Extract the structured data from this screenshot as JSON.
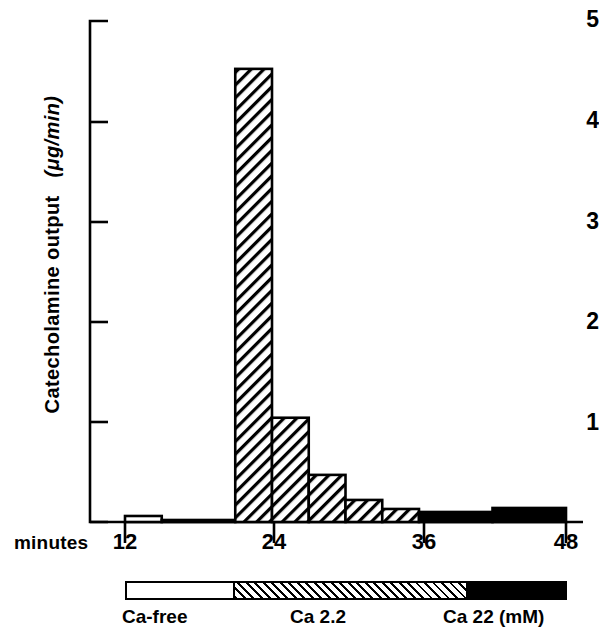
{
  "chart_data": {
    "type": "bar",
    "title": "",
    "xlabel": "minutes",
    "ylabel": "Catecholamine output  (μg/min)",
    "ylabel_parts": {
      "main": "Catecholamine output",
      "units": "(μg/min)"
    },
    "xlim": [
      12,
      48
    ],
    "ylim": [
      0,
      5
    ],
    "grid": false,
    "legend_position": "below-axis",
    "xticks": [
      12,
      24,
      36,
      48
    ],
    "xtick_labels": [
      "12",
      "24",
      "36",
      "48"
    ],
    "yticks": [
      1,
      2,
      3,
      4,
      5
    ],
    "ytick_labels": [
      "1",
      "2",
      "3",
      "4",
      "5"
    ],
    "bar_width_minutes": 3,
    "x_left_edges": [
      12,
      15,
      21,
      24,
      27,
      30,
      33,
      36,
      42
    ],
    "categories": [
      "12-15",
      "15-21",
      "21-24",
      "24-27",
      "27-30",
      "30-33",
      "33-36",
      "36-42",
      "42-48"
    ],
    "values": [
      0.06,
      0.02,
      4.52,
      1.04,
      0.47,
      0.22,
      0.13,
      0.1,
      0.14
    ],
    "bars": [
      {
        "label": "12-15",
        "x0": 12,
        "x1": 15,
        "value": 0.06,
        "fill": "white"
      },
      {
        "label": "15-21",
        "x0": 15,
        "x1": 21,
        "value": 0.02,
        "fill": "white"
      },
      {
        "label": "21-24",
        "x0": 21,
        "x1": 24,
        "value": 4.52,
        "fill": "hatch"
      },
      {
        "label": "24-27",
        "x0": 24,
        "x1": 27,
        "value": 1.04,
        "fill": "hatch"
      },
      {
        "label": "27-30",
        "x0": 27,
        "x1": 30,
        "value": 0.47,
        "fill": "hatch"
      },
      {
        "label": "30-33",
        "x0": 30,
        "x1": 33,
        "value": 0.22,
        "fill": "hatch"
      },
      {
        "label": "33-36",
        "x0": 33,
        "x1": 36,
        "value": 0.13,
        "fill": "hatch"
      },
      {
        "label": "36-42",
        "x0": 36,
        "x1": 42,
        "value": 0.1,
        "fill": "black"
      },
      {
        "label": "42-48",
        "x0": 42,
        "x1": 48,
        "value": 0.14,
        "fill": "black"
      }
    ],
    "legend": [
      {
        "key": "ca-free",
        "label": "Ca-free",
        "fill": "white",
        "x0": 12,
        "x1": 21
      },
      {
        "key": "ca-2-2",
        "label": "Ca  2.2",
        "fill": "hatch",
        "x0": 21,
        "x1": 36
      },
      {
        "key": "ca-22",
        "label": "Ca 22 (mM)",
        "fill": "black",
        "x0": 36,
        "x1": 48
      }
    ],
    "colors": {
      "ink": "#000000",
      "background": "#ffffff"
    }
  }
}
